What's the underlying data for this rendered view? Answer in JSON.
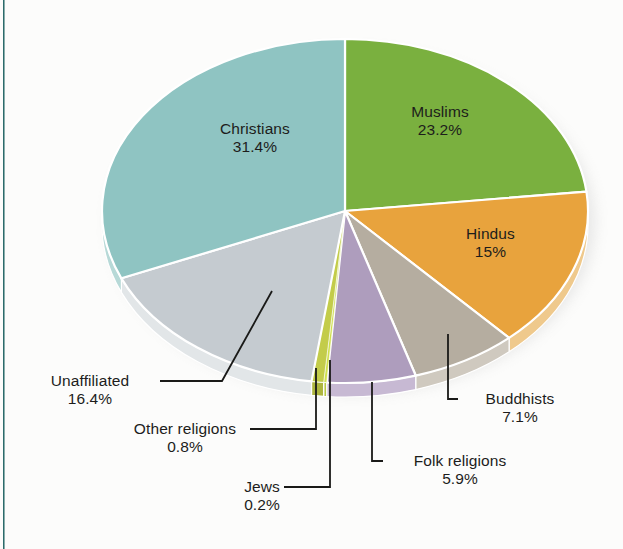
{
  "figure": {
    "background_color": "#fcfcfb",
    "rule_color": "#2c6b6b",
    "label_text_color": "#1d1d1b",
    "leader_line_color": "#1a1a18"
  },
  "chart_data": {
    "type": "pie",
    "title": "",
    "subtitle": "",
    "xlabel": "",
    "ylabel": "",
    "three_d": true,
    "start_angle_deg": 0,
    "direction": "clockwise",
    "legend_position": "none",
    "grid": false,
    "units": "percent",
    "categories": [
      "Muslims",
      "Hindus",
      "Buddhists",
      "Folk religions",
      "Jews",
      "Other religions",
      "Unaffiliated",
      "Christians"
    ],
    "values": [
      23.2,
      15,
      7.1,
      5.9,
      0.2,
      0.8,
      16.4,
      31.4
    ],
    "labels": [
      "23.2%",
      "15%",
      "7.1%",
      "5.9%",
      "0.2%",
      "0.8%",
      "16.4%",
      "31.4%"
    ],
    "colors": [
      "#7ab03f",
      "#e8a33d",
      "#b5ada0",
      "#ae9dbd",
      "#cfe04d",
      "#c3cc4a",
      "#c5cbd0",
      "#8fc4c2"
    ],
    "slices": [
      {
        "name": "Muslims",
        "value": 23.2,
        "label": "23.2%",
        "color": "#7ab03f",
        "side_color": "#6d9e38",
        "placement": "inside"
      },
      {
        "name": "Hindus",
        "value": 15,
        "label": "15%",
        "color": "#e8a33d",
        "side_color": "#efc98c",
        "placement": "inside"
      },
      {
        "name": "Buddhists",
        "value": 7.1,
        "label": "7.1%",
        "color": "#b5ada0",
        "side_color": "#cfc9bf",
        "placement": "callout"
      },
      {
        "name": "Folk religions",
        "value": 5.9,
        "label": "5.9%",
        "color": "#ae9dbd",
        "side_color": "#c7b9d3",
        "placement": "callout"
      },
      {
        "name": "Jews",
        "value": 0.2,
        "label": "0.2%",
        "color": "#cfe04d",
        "side_color": "#b9c943",
        "placement": "callout"
      },
      {
        "name": "Other religions",
        "value": 0.8,
        "label": "0.8%",
        "color": "#c3cc4a",
        "side_color": "#aeb63f",
        "placement": "callout"
      },
      {
        "name": "Unaffiliated",
        "value": 16.4,
        "label": "16.4%",
        "color": "#c5cbd0",
        "side_color": "#e2e6e8",
        "placement": "callout"
      },
      {
        "name": "Christians",
        "value": 31.4,
        "label": "31.4%",
        "color": "#8fc4c2",
        "side_color": "#b7d9d7",
        "placement": "inside"
      }
    ]
  },
  "inside_labels": {
    "muslims": {
      "name": "Muslims",
      "pct": "23.2%"
    },
    "christians": {
      "name": "Christians",
      "pct": "31.4%"
    },
    "hindus": {
      "name": "Hindus",
      "pct": "15%"
    }
  },
  "callouts": {
    "unaffiliated": {
      "name": "Unaffiliated",
      "pct": "16.4%"
    },
    "other_religions": {
      "name": "Other religions",
      "pct": "0.8%"
    },
    "jews": {
      "name": "Jews",
      "pct": "0.2%"
    },
    "folk_religions": {
      "name": "Folk religions",
      "pct": "5.9%"
    },
    "buddhists": {
      "name": "Buddhists",
      "pct": "7.1%"
    }
  }
}
